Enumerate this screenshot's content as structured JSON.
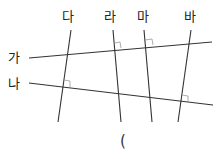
{
  "diagram": {
    "top_labels": [
      "다",
      "라",
      "마",
      "바"
    ],
    "left_labels": [
      "가",
      "나"
    ],
    "answer_paren": "(",
    "line_color": "#333333",
    "right_angle_color": "#999999"
  }
}
